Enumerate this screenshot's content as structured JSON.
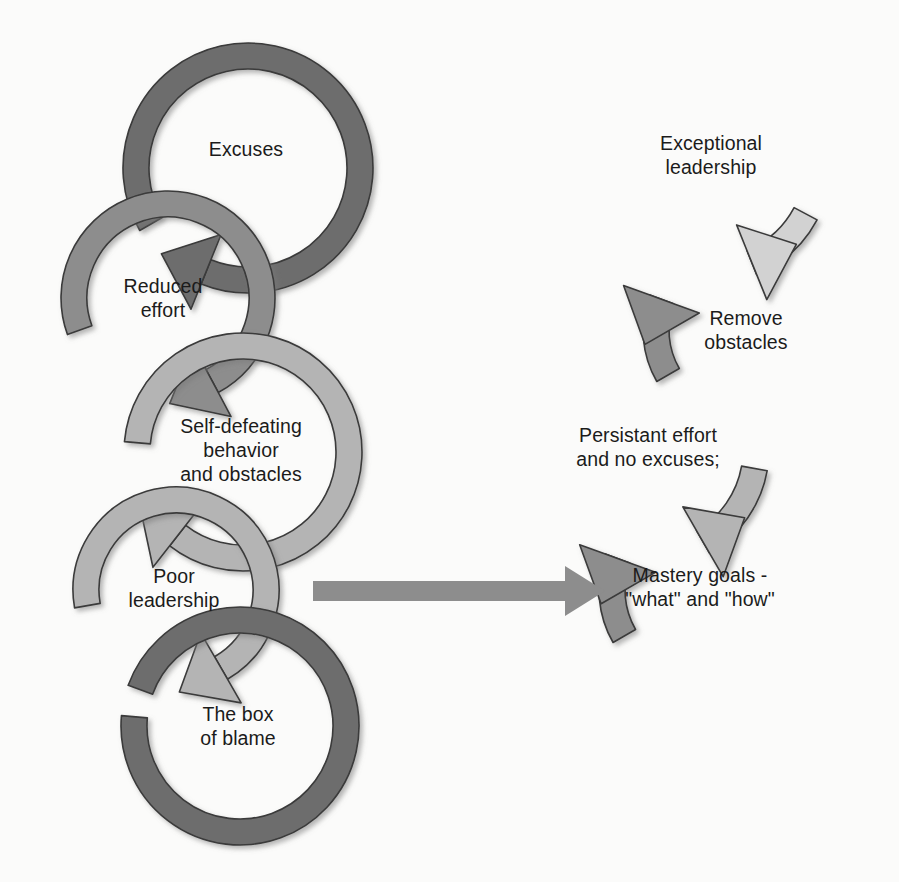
{
  "diagram": {
    "type": "cycle-diagram",
    "background_color": "#fbfbfa",
    "text_color": "#1b1b1b",
    "palette": {
      "dark_gray": "#6d6d6d",
      "medium_gray": "#8d8d8d",
      "light_gray": "#b4b4b4",
      "pale_gray": "#d2d2d2",
      "outline": "#3a3a3a",
      "connector_arrow": "#8d8d8d"
    },
    "left_column": {
      "name": "vicious-cycle",
      "direction": "clockwise-descending",
      "nodes": [
        {
          "id": "excuses",
          "label": "Excuses",
          "color": "#6d6d6d",
          "cx": 248,
          "cy": 168,
          "r": 112,
          "thickness": 26,
          "gap_start_deg": 150,
          "gap_end_deg": 112,
          "arrow_deg": 112,
          "label_x": 246,
          "label_y": 149
        },
        {
          "id": "reduced-effort",
          "label": "Reduced\neffort",
          "color": "#8d8d8d",
          "cx": 168,
          "cy": 298,
          "r": 94,
          "thickness": 26,
          "gap_start_deg": 160,
          "gap_end_deg": 62,
          "arrow_deg": 62,
          "label_x": 163,
          "label_y": 298
        },
        {
          "id": "self-defeating-behavior",
          "label": "Self-defeating\nbehavior\nand obstacles",
          "color": "#b4b4b4",
          "cx": 243,
          "cy": 452,
          "r": 106,
          "thickness": 26,
          "gap_start_deg": 185,
          "gap_end_deg": 128,
          "arrow_deg": 128,
          "label_x": 241,
          "label_y": 450
        },
        {
          "id": "poor-leadership",
          "label": "Poor\nleadership",
          "color": "#b4b4b4",
          "cx": 176,
          "cy": 590,
          "r": 90,
          "thickness": 26,
          "gap_start_deg": 170,
          "gap_end_deg": 60,
          "arrow_deg": 60,
          "label_x": 174,
          "label_y": 588
        },
        {
          "id": "box-of-blame",
          "label": "The box\nof blame",
          "color": "#6d6d6d",
          "cx": 240,
          "cy": 726,
          "r": 106,
          "thickness": 26,
          "gap_start_deg": 200,
          "gap_end_deg": 185,
          "arrow_deg": null,
          "label_x": 238,
          "label_y": 726
        }
      ]
    },
    "right_column": {
      "name": "virtuous-cycle",
      "direction": "counterclockwise-ascending",
      "nodes": [
        {
          "id": "exceptional-leadership",
          "label": "Exceptional\nleadership",
          "color": "#d2d2d2",
          "cx": 712,
          "cy": 164,
          "r": 106,
          "thickness": 26,
          "gap_start_deg": 28,
          "gap_end_deg": 68,
          "arrow_deg": 68,
          "label_x": 711,
          "label_y": 155
        },
        {
          "id": "remove-obstacles",
          "label": "Remove\nobstacles",
          "color": "#8d8d8d",
          "cx": 746,
          "cy": 330,
          "r": 90,
          "thickness": 26,
          "gap_start_deg": 150,
          "gap_end_deg": 200,
          "arrow_deg": 200,
          "label_x": 746,
          "label_y": 330
        },
        {
          "id": "persistant-effort",
          "label": "Persistant effort\nand no excuses;",
          "color": "#b4b4b4",
          "cx": 650,
          "cy": 450,
          "r": 106,
          "thickness": 26,
          "gap_start_deg": 10,
          "gap_end_deg": 60,
          "arrow_deg": 60,
          "label_x": 648,
          "label_y": 447
        },
        {
          "id": "mastery-goals",
          "label": "Mastery goals -\n\"what\" and \"how\"",
          "color": "#8d8d8d",
          "cx": 704,
          "cy": 590,
          "r": 92,
          "thickness": 26,
          "gap_start_deg": 150,
          "gap_end_deg": 200,
          "arrow_deg": 200,
          "label_x": 700,
          "label_y": 587
        }
      ]
    },
    "connector": {
      "id": "transition-arrow",
      "label": "",
      "color": "#8d8d8d",
      "x1": 313,
      "x2": 605,
      "y": 591,
      "shaft_thickness": 20,
      "head_width": 40,
      "head_height": 50
    }
  }
}
